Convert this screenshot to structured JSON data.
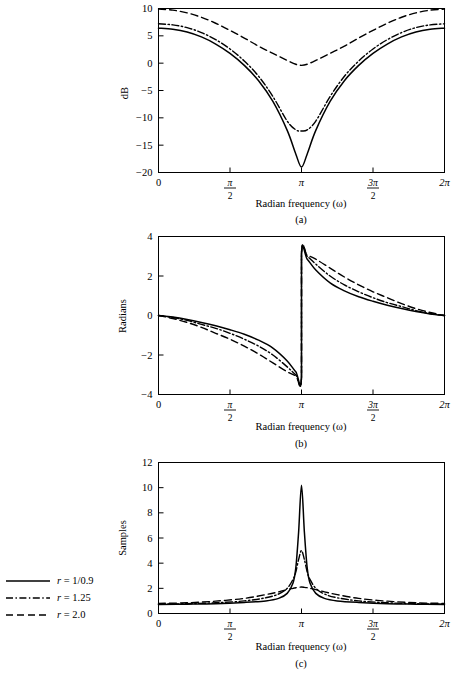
{
  "figure": {
    "xlabel": "Radian frequency (ω)",
    "xtick_labels": [
      "0",
      "π/2",
      "π",
      "3π/2",
      "2π"
    ],
    "captions": {
      "a": "(a)",
      "b": "(b)",
      "c": "(c)"
    }
  },
  "legend": {
    "entries": [
      {
        "label": "r = 1/0.9",
        "style": "solid"
      },
      {
        "label": "r = 1.25",
        "style": "dash-dot"
      },
      {
        "label": "r = 2.0",
        "style": "dashed"
      }
    ]
  },
  "chart_data": [
    {
      "type": "line",
      "panel": "a",
      "title": "",
      "xlabel": "Radian frequency (ω)",
      "ylabel": "dB",
      "xlim": [
        0,
        6.283185307179586
      ],
      "ylim": [
        -20,
        10
      ],
      "yticks": [
        -20,
        -15,
        -10,
        -5,
        0,
        5,
        10
      ],
      "ytick_labels": [
        "-20",
        "-15",
        "-10",
        "-5",
        "0",
        "5",
        "10"
      ],
      "xticks": [
        0,
        1.5707963,
        3.1415927,
        4.712389,
        6.2831853
      ],
      "xtick_labels": [
        "0",
        "π/2",
        "π",
        "3π/2",
        "2π"
      ],
      "grid": false,
      "legend_position": "outside-left",
      "series": [
        {
          "name": "r = 1/0.9",
          "style": "solid",
          "x": [
            0,
            0.3141593,
            0.6283185,
            0.9424778,
            1.2566371,
            1.5707963,
            1.8849556,
            2.1991149,
            2.5132741,
            2.8274334,
            3.0159289,
            3.1415927,
            3.2672565,
            3.4557519,
            3.7699112,
            4.0840704,
            4.3982297,
            4.712389,
            5.0265482,
            5.3407075,
            5.6548668,
            5.969026,
            6.2831853
          ],
          "y": [
            6.4,
            6.2,
            5.7,
            4.8,
            3.5,
            1.8,
            -0.4,
            -3.2,
            -7.0,
            -12.3,
            -16.6,
            -19.0,
            -16.6,
            -12.3,
            -7.0,
            -3.2,
            -0.4,
            1.8,
            3.5,
            4.8,
            5.7,
            6.2,
            6.4
          ]
        },
        {
          "name": "r = 1.25",
          "style": "dash-dot",
          "x": [
            0,
            0.3141593,
            0.6283185,
            0.9424778,
            1.2566371,
            1.5707963,
            1.8849556,
            2.1991149,
            2.5132741,
            2.8274334,
            3.0159289,
            3.1415927,
            3.2672565,
            3.4557519,
            3.7699112,
            4.0840704,
            4.3982297,
            4.712389,
            5.0265482,
            5.3407075,
            5.6548668,
            5.969026,
            6.2831853
          ],
          "y": [
            7.2,
            7.0,
            6.5,
            5.6,
            4.3,
            2.6,
            0.4,
            -2.4,
            -6.1,
            -10.6,
            -12.2,
            -12.4,
            -12.2,
            -10.6,
            -6.1,
            -2.4,
            0.4,
            2.6,
            4.3,
            5.6,
            6.5,
            7.0,
            7.2
          ]
        },
        {
          "name": "r = 2.0",
          "style": "dashed",
          "x": [
            0,
            0.3141593,
            0.6283185,
            0.9424778,
            1.2566371,
            1.5707963,
            1.8849556,
            2.1991149,
            2.5132741,
            2.8274334,
            3.0159289,
            3.1415927,
            3.2672565,
            3.4557519,
            3.7699112,
            4.0840704,
            4.3982297,
            4.712389,
            5.0265482,
            5.3407075,
            5.6548668,
            5.969026,
            6.2831853
          ],
          "y": [
            9.9,
            9.7,
            9.2,
            8.4,
            7.3,
            6.0,
            4.6,
            3.1,
            1.8,
            0.5,
            -0.2,
            -0.4,
            -0.2,
            0.5,
            1.8,
            3.1,
            4.6,
            6.0,
            7.3,
            8.4,
            9.2,
            9.7,
            9.9
          ]
        }
      ]
    },
    {
      "type": "line",
      "panel": "b",
      "title": "",
      "xlabel": "Radian frequency (ω)",
      "ylabel": "Radians",
      "xlim": [
        0,
        6.283185307179586
      ],
      "ylim": [
        -4,
        4
      ],
      "yticks": [
        -4,
        -2,
        0,
        2,
        4
      ],
      "ytick_labels": [
        "-4",
        "-2",
        "0",
        "2",
        "4"
      ],
      "xticks": [
        0,
        1.5707963,
        3.1415927,
        4.712389,
        6.2831853
      ],
      "xtick_labels": [
        "0",
        "π/2",
        "π",
        "3π/2",
        "2π"
      ],
      "grid": false,
      "discontinuity_at": 3.1415927,
      "series": [
        {
          "name": "r = 1/0.9",
          "style": "solid",
          "x": [
            0,
            0.3141593,
            0.6283185,
            0.9424778,
            1.2566371,
            1.5707963,
            1.8849556,
            2.1991149,
            2.5132741,
            2.8274334,
            3.0159289,
            3.1415927,
            3.1415927,
            3.2672565,
            3.4557519,
            3.7699112,
            4.0840704,
            4.3982297,
            4.712389,
            5.0265482,
            5.3407075,
            5.6548668,
            5.969026,
            6.2831853
          ],
          "y": [
            0.0,
            -0.08,
            -0.2,
            -0.35,
            -0.52,
            -0.72,
            -0.95,
            -1.25,
            -1.65,
            -2.3,
            -2.85,
            -3.1,
            3.1,
            2.85,
            2.3,
            1.65,
            1.25,
            0.95,
            0.72,
            0.52,
            0.35,
            0.2,
            0.08,
            0.0
          ]
        },
        {
          "name": "r = 1.25",
          "style": "dash-dot",
          "x": [
            0,
            0.3141593,
            0.6283185,
            0.9424778,
            1.2566371,
            1.5707963,
            1.8849556,
            2.1991149,
            2.5132741,
            2.8274334,
            3.0159289,
            3.1415927,
            3.1415927,
            3.2672565,
            3.4557519,
            3.7699112,
            4.0840704,
            4.3982297,
            4.712389,
            5.0265482,
            5.3407075,
            5.6548668,
            5.969026,
            6.2831853
          ],
          "y": [
            0.0,
            -0.1,
            -0.25,
            -0.45,
            -0.65,
            -0.9,
            -1.2,
            -1.55,
            -2.0,
            -2.6,
            -3.0,
            -3.15,
            3.15,
            3.0,
            2.6,
            2.0,
            1.55,
            1.2,
            0.9,
            0.65,
            0.45,
            0.25,
            0.1,
            0.0
          ]
        },
        {
          "name": "r = 2.0",
          "style": "dashed",
          "x": [
            0,
            0.3141593,
            0.6283185,
            0.9424778,
            1.2566371,
            1.5707963,
            1.8849556,
            2.1991149,
            2.5132741,
            2.8274334,
            3.0159289,
            3.1415927,
            3.1415927,
            3.2672565,
            3.4557519,
            3.7699112,
            4.0840704,
            4.3982297,
            4.712389,
            5.0265482,
            5.3407075,
            5.6548668,
            5.969026,
            6.2831853
          ],
          "y": [
            0.0,
            -0.15,
            -0.35,
            -0.6,
            -0.9,
            -1.2,
            -1.55,
            -1.95,
            -2.4,
            -2.85,
            -3.05,
            -3.14,
            3.14,
            3.05,
            2.85,
            2.4,
            1.95,
            1.55,
            1.2,
            0.9,
            0.6,
            0.35,
            0.15,
            0.0
          ]
        }
      ]
    },
    {
      "type": "line",
      "panel": "c",
      "title": "",
      "xlabel": "Radian frequency (ω)",
      "ylabel": "Samples",
      "xlim": [
        0,
        6.283185307179586
      ],
      "ylim": [
        0,
        12
      ],
      "yticks": [
        0,
        2,
        4,
        6,
        8,
        10,
        12
      ],
      "ytick_labels": [
        "0",
        "2",
        "4",
        "6",
        "8",
        "10",
        "12"
      ],
      "xticks": [
        0,
        1.5707963,
        3.1415927,
        4.712389,
        6.2831853
      ],
      "xtick_labels": [
        "0",
        "π/2",
        "π",
        "3π/2",
        "2π"
      ],
      "grid": false,
      "series": [
        {
          "name": "r = 1/0.9",
          "style": "solid",
          "x": [
            0,
            0.6283185,
            1.2566371,
            1.8849556,
            2.3561945,
            2.6389378,
            2.8274334,
            2.9530972,
            3.0159289,
            3.0787607,
            3.1415927,
            3.2044246,
            3.2672565,
            3.3300882,
            3.4557519,
            3.6442474,
            3.9269908,
            4.3982297,
            5.0265482,
            5.6548668,
            6.2831853
          ],
          "y": [
            0.72,
            0.74,
            0.78,
            0.88,
            1.0,
            1.2,
            1.6,
            2.4,
            3.6,
            6.5,
            10.2,
            6.5,
            3.6,
            2.4,
            1.6,
            1.2,
            1.0,
            0.88,
            0.78,
            0.74,
            0.72
          ]
        },
        {
          "name": "r = 1.25",
          "style": "dash-dot",
          "x": [
            0,
            0.6283185,
            1.2566371,
            1.8849556,
            2.3561945,
            2.6389378,
            2.8274334,
            2.9530972,
            3.0159289,
            3.0787607,
            3.1415927,
            3.2044246,
            3.2672565,
            3.3300882,
            3.4557519,
            3.6442474,
            3.9269908,
            4.3982297,
            5.0265482,
            5.6548668,
            6.2831853
          ],
          "y": [
            0.74,
            0.78,
            0.85,
            1.0,
            1.25,
            1.55,
            2.0,
            2.7,
            3.3,
            4.3,
            5.0,
            4.3,
            3.3,
            2.7,
            2.0,
            1.55,
            1.25,
            1.0,
            0.85,
            0.78,
            0.74
          ]
        },
        {
          "name": "r = 2.0",
          "style": "dashed",
          "x": [
            0,
            0.6283185,
            1.2566371,
            1.8849556,
            2.3561945,
            2.6389378,
            2.8274334,
            2.9530972,
            3.0159289,
            3.0787607,
            3.1415927,
            3.2044246,
            3.2672565,
            3.3300882,
            3.4557519,
            3.6442474,
            3.9269908,
            4.3982297,
            5.0265482,
            5.6548668,
            6.2831853
          ],
          "y": [
            0.8,
            0.85,
            0.98,
            1.2,
            1.5,
            1.72,
            1.9,
            2.0,
            2.05,
            2.08,
            2.1,
            2.08,
            2.05,
            2.0,
            1.9,
            1.72,
            1.5,
            1.2,
            0.98,
            0.85,
            0.8
          ]
        }
      ]
    }
  ]
}
